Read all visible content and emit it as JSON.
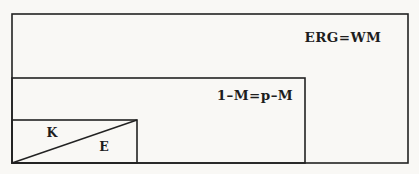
{
  "diagram": {
    "type": "nested-rectangles-figure",
    "colors": {
      "paper": "#f9f8f5",
      "ink": "#222222"
    },
    "labels": {
      "outer_rect": "ERG=WM",
      "middle_rect": "1–M=p–M",
      "small_rect_upper": "K",
      "small_rect_lower": "E"
    }
  }
}
